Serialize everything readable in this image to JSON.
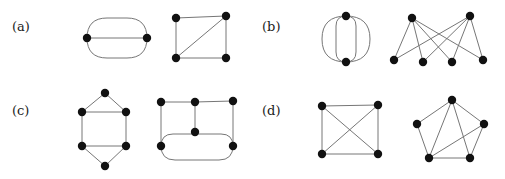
{
  "figure": {
    "width": 505,
    "height": 179,
    "background_color": "#ffffff",
    "edge_color": "#767676",
    "vertex_color": "#111111",
    "vertex_radius": 4.2,
    "edge_width": 1
  },
  "panels": [
    {
      "label": "(a)",
      "label_x": 12,
      "label_y": 20,
      "graphs": [
        {
          "name": "graph-a-1",
          "description": "two vertices joined by three parallel edges",
          "x": 75,
          "y": 10,
          "width": 84,
          "height": 56,
          "vertices": [
            {
              "id": "v1",
              "x": 12,
              "y": 28
            },
            {
              "id": "v2",
              "x": 72,
              "y": 28
            }
          ],
          "edges": [
            {
              "from": "v1",
              "to": "v2",
              "type": "line"
            },
            {
              "from": "v1",
              "to": "v2",
              "type": "stadium",
              "bulge": 20
            },
            {
              "from": "v1",
              "to": "v2",
              "type": "stadium",
              "bulge": -20
            }
          ]
        },
        {
          "name": "graph-a-2",
          "description": "four-cycle with one diagonal chord",
          "x": 168,
          "y": 10,
          "width": 66,
          "height": 56,
          "vertices": [
            {
              "id": "tl",
              "x": 8,
              "y": 8
            },
            {
              "id": "tr",
              "x": 58,
              "y": 6
            },
            {
              "id": "bl",
              "x": 8,
              "y": 48
            },
            {
              "id": "br",
              "x": 58,
              "y": 48
            }
          ],
          "edges": [
            {
              "from": "tl",
              "to": "tr",
              "type": "line"
            },
            {
              "from": "tr",
              "to": "br",
              "type": "line"
            },
            {
              "from": "br",
              "to": "bl",
              "type": "line"
            },
            {
              "from": "bl",
              "to": "tl",
              "type": "line"
            },
            {
              "from": "bl",
              "to": "tr",
              "type": "line"
            }
          ]
        }
      ]
    },
    {
      "label": "(b)",
      "label_x": 262,
      "label_y": 20,
      "graphs": [
        {
          "name": "graph-b-1",
          "description": "two vertices joined by four parallel edges",
          "x": 318,
          "y": 8,
          "width": 56,
          "height": 62,
          "vertices": [
            {
              "id": "top",
              "x": 28,
              "y": 8
            },
            {
              "id": "bot",
              "x": 28,
              "y": 54
            }
          ],
          "edges": [
            {
              "from": "top",
              "to": "bot",
              "type": "stadium",
              "bulge": 10
            },
            {
              "from": "top",
              "to": "bot",
              "type": "stadium",
              "bulge": -10
            },
            {
              "from": "top",
              "to": "bot",
              "type": "stadium",
              "bulge": 24
            },
            {
              "from": "top",
              "to": "bot",
              "type": "stadium",
              "bulge": -24
            }
          ]
        },
        {
          "name": "graph-b-2",
          "description": "complete bipartite graph K(2,4)",
          "x": 390,
          "y": 10,
          "width": 100,
          "height": 58,
          "vertices": [
            {
              "id": "t1",
              "x": 22,
              "y": 8
            },
            {
              "id": "t2",
              "x": 80,
              "y": 6
            },
            {
              "id": "b1",
              "x": 4,
              "y": 50
            },
            {
              "id": "b2",
              "x": 33,
              "y": 52
            },
            {
              "id": "b3",
              "x": 62,
              "y": 52
            },
            {
              "id": "b4",
              "x": 93,
              "y": 50
            }
          ],
          "edges": [
            {
              "from": "t1",
              "to": "b1",
              "type": "line"
            },
            {
              "from": "t1",
              "to": "b2",
              "type": "line"
            },
            {
              "from": "t1",
              "to": "b3",
              "type": "line"
            },
            {
              "from": "t1",
              "to": "b4",
              "type": "line"
            },
            {
              "from": "t2",
              "to": "b1",
              "type": "line"
            },
            {
              "from": "t2",
              "to": "b2",
              "type": "line"
            },
            {
              "from": "t2",
              "to": "b3",
              "type": "line"
            },
            {
              "from": "t2",
              "to": "b4",
              "type": "line"
            }
          ]
        }
      ]
    },
    {
      "label": "(c)",
      "label_x": 12,
      "label_y": 104,
      "graphs": [
        {
          "name": "graph-c-1",
          "description": "six vertices: top apex, two upper, two lower, bottom apex",
          "x": 74,
          "y": 88,
          "width": 60,
          "height": 84,
          "vertices": [
            {
              "id": "t",
              "x": 31,
              "y": 5
            },
            {
              "id": "ul",
              "x": 8,
              "y": 24
            },
            {
              "id": "ur",
              "x": 52,
              "y": 24
            },
            {
              "id": "ll",
              "x": 8,
              "y": 58
            },
            {
              "id": "lr",
              "x": 52,
              "y": 58
            },
            {
              "id": "b",
              "x": 31,
              "y": 78
            }
          ],
          "edges": [
            {
              "from": "t",
              "to": "ul",
              "type": "line"
            },
            {
              "from": "t",
              "to": "ur",
              "type": "line"
            },
            {
              "from": "ul",
              "to": "ur",
              "type": "line"
            },
            {
              "from": "ul",
              "to": "ll",
              "type": "line"
            },
            {
              "from": "ur",
              "to": "lr",
              "type": "line"
            },
            {
              "from": "ll",
              "to": "lr",
              "type": "line"
            },
            {
              "from": "ll",
              "to": "b",
              "type": "line"
            },
            {
              "from": "lr",
              "to": "b",
              "type": "line"
            }
          ]
        },
        {
          "name": "graph-c-2",
          "description": "three top vertices, one centre vertex, two bottom vertices joined by a double arc",
          "x": 155,
          "y": 96,
          "width": 90,
          "height": 70,
          "vertices": [
            {
              "id": "t1",
              "x": 6,
              "y": 6
            },
            {
              "id": "t2",
              "x": 40,
              "y": 6
            },
            {
              "id": "t3",
              "x": 78,
              "y": 5
            },
            {
              "id": "c",
              "x": 40,
              "y": 36
            },
            {
              "id": "bl",
              "x": 6,
              "y": 50
            },
            {
              "id": "br",
              "x": 78,
              "y": 50
            }
          ],
          "edges": [
            {
              "from": "t1",
              "to": "t2",
              "type": "line"
            },
            {
              "from": "t2",
              "to": "t3",
              "type": "line"
            },
            {
              "from": "t1",
              "to": "bl",
              "type": "line"
            },
            {
              "from": "t2",
              "to": "c",
              "type": "line"
            },
            {
              "from": "t3",
              "to": "br",
              "type": "line"
            },
            {
              "from": "bl",
              "to": "br",
              "type": "stadium",
              "bulge": -12
            },
            {
              "from": "bl",
              "to": "br",
              "type": "stadium",
              "bulge": 14
            }
          ]
        }
      ]
    },
    {
      "label": "(d)",
      "label_x": 262,
      "label_y": 104,
      "graphs": [
        {
          "name": "graph-d-1",
          "description": "complete graph K4 drawn as a square with both diagonals",
          "x": 316,
          "y": 98,
          "width": 70,
          "height": 66,
          "vertices": [
            {
              "id": "tl",
              "x": 6,
              "y": 8
            },
            {
              "id": "tr",
              "x": 62,
              "y": 7
            },
            {
              "id": "bl",
              "x": 6,
              "y": 56
            },
            {
              "id": "br",
              "x": 62,
              "y": 56
            }
          ],
          "edges": [
            {
              "from": "tl",
              "to": "tr",
              "type": "line"
            },
            {
              "from": "tr",
              "to": "br",
              "type": "line"
            },
            {
              "from": "br",
              "to": "bl",
              "type": "line"
            },
            {
              "from": "bl",
              "to": "tl",
              "type": "line"
            },
            {
              "from": "tl",
              "to": "br",
              "type": "line"
            },
            {
              "from": "tr",
              "to": "bl",
              "type": "line"
            }
          ]
        },
        {
          "name": "graph-d-2",
          "description": "five vertices in a pentagon with three chords",
          "x": 412,
          "y": 94,
          "width": 80,
          "height": 74,
          "vertices": [
            {
              "id": "t",
              "x": 40,
              "y": 6
            },
            {
              "id": "ul",
              "x": 5,
              "y": 30
            },
            {
              "id": "ur",
              "x": 72,
              "y": 30
            },
            {
              "id": "bl",
              "x": 17,
              "y": 64
            },
            {
              "id": "br",
              "x": 58,
              "y": 64
            }
          ],
          "edges": [
            {
              "from": "t",
              "to": "ul",
              "type": "line"
            },
            {
              "from": "t",
              "to": "ur",
              "type": "line"
            },
            {
              "from": "t",
              "to": "bl",
              "type": "line"
            },
            {
              "from": "t",
              "to": "br",
              "type": "line"
            },
            {
              "from": "ul",
              "to": "bl",
              "type": "line"
            },
            {
              "from": "ur",
              "to": "br",
              "type": "line"
            },
            {
              "from": "bl",
              "to": "br",
              "type": "line"
            },
            {
              "from": "bl",
              "to": "ur",
              "type": "line"
            }
          ]
        }
      ]
    }
  ]
}
